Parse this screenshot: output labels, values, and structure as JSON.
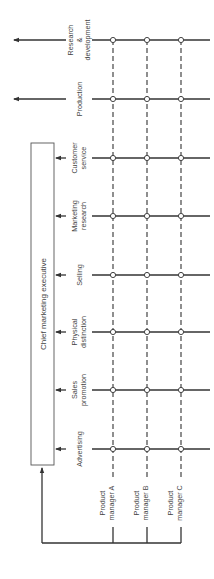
{
  "diagram": {
    "executive_box": {
      "label": "Chief marketing executive"
    },
    "functions": [
      {
        "id": "research",
        "lines": [
          "Research",
          "&",
          "development"
        ],
        "y": 40,
        "external": true
      },
      {
        "id": "production",
        "lines": [
          "Production"
        ],
        "y": 99,
        "external": true
      },
      {
        "id": "customer-service",
        "lines": [
          "Customer",
          "service"
        ],
        "y": 158,
        "external": false
      },
      {
        "id": "marketing-research",
        "lines": [
          "Marketing",
          "research"
        ],
        "y": 216,
        "external": false
      },
      {
        "id": "selling",
        "lines": [
          "Selling"
        ],
        "y": 275,
        "external": false
      },
      {
        "id": "physical-distinction",
        "lines": [
          "Physical",
          "distinction"
        ],
        "y": 332,
        "external": false
      },
      {
        "id": "sales-promotion",
        "lines": [
          "Sales",
          "promotion"
        ],
        "y": 390,
        "external": false
      },
      {
        "id": "advertising",
        "lines": [
          "Advertising"
        ],
        "y": 449,
        "external": false
      }
    ],
    "product_managers": [
      {
        "id": "a",
        "lines": [
          "Product",
          "manager A"
        ],
        "x": 113
      },
      {
        "id": "b",
        "lines": [
          "Product",
          "manager B"
        ],
        "x": 147
      },
      {
        "id": "c",
        "lines": [
          "Product",
          "manager C"
        ],
        "x": 181
      }
    ],
    "colors": {
      "line": "#333333",
      "node_fill": "#ffffff"
    }
  }
}
